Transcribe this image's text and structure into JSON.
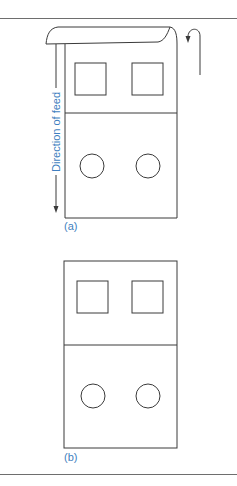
{
  "figure": {
    "panel_a": {
      "label": "(a)",
      "annotation": "Direction of feed",
      "shapes": {
        "upper_section": [
          "square",
          "square"
        ],
        "lower_section": [
          "circle",
          "circle"
        ]
      }
    },
    "panel_b": {
      "label": "(b)",
      "shapes": {
        "upper_section": [
          "square",
          "square"
        ],
        "lower_section": [
          "circle",
          "circle"
        ]
      }
    }
  },
  "colors": {
    "line": "#3a3a3a",
    "label": "#3f7fc0",
    "rule": "#6e6e6e"
  }
}
